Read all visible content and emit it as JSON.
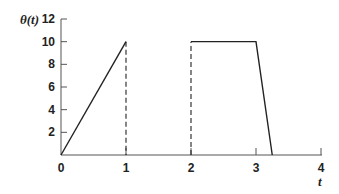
{
  "chart_data": {
    "type": "line",
    "title": "",
    "xlabel": "t",
    "ylabel": "θ(t)",
    "xlim": [
      0,
      4
    ],
    "ylim": [
      0,
      12
    ],
    "grid": false,
    "legend": null,
    "x_ticks": [
      0,
      1,
      2,
      3,
      4
    ],
    "y_ticks": [
      2,
      4,
      6,
      8,
      10,
      12
    ],
    "x_tick_labels": [
      "0",
      "1",
      "2",
      "3",
      "4"
    ],
    "y_tick_labels": [
      "2",
      "4",
      "6",
      "8",
      "10",
      "12"
    ],
    "series": [
      {
        "name": "θ(t)",
        "style": "solid",
        "segments": [
          {
            "x": [
              0,
              1
            ],
            "y": [
              0,
              10
            ]
          },
          {
            "x": [
              2,
              3,
              3.25
            ],
            "y": [
              10,
              10,
              0
            ]
          }
        ]
      },
      {
        "name": "discontinuity markers",
        "style": "dashed",
        "segments": [
          {
            "x": [
              1,
              1
            ],
            "y": [
              10,
              0
            ]
          },
          {
            "x": [
              2,
              2
            ],
            "y": [
              0,
              10
            ]
          }
        ]
      }
    ]
  },
  "colors": {
    "line": "#222222",
    "axis": "#555555"
  }
}
